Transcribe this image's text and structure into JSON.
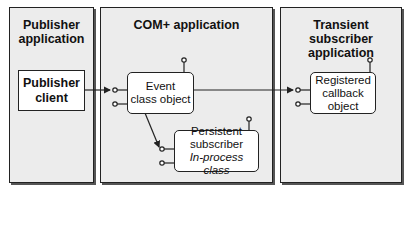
{
  "panels": {
    "publisher": {
      "title_line1": "Publisher",
      "title_line2": "application"
    },
    "complus": {
      "title": "COM+ application"
    },
    "transient": {
      "title_line1": "Transient subscriber",
      "title_line2": "application"
    }
  },
  "components": {
    "publisher_client": {
      "line1": "Publisher",
      "line2": "client"
    },
    "event_class": {
      "line1": "Event",
      "line2": "class object"
    },
    "persistent_subscriber": {
      "line1": "Persistent",
      "line2": "subscriber",
      "line3": "In-process class"
    },
    "registered_callback": {
      "line1": "Registered",
      "line2": "callback",
      "line3": "object"
    }
  },
  "connections": [
    {
      "from": "Publisher client",
      "to": "Event class object"
    },
    {
      "from": "Event class object",
      "to": "Persistent subscriber"
    },
    {
      "from": "Event class object",
      "to": "Registered callback object"
    }
  ],
  "colors": {
    "panel_bg": "#ececec",
    "stroke": "#222222",
    "box_bg": "#ffffff"
  }
}
